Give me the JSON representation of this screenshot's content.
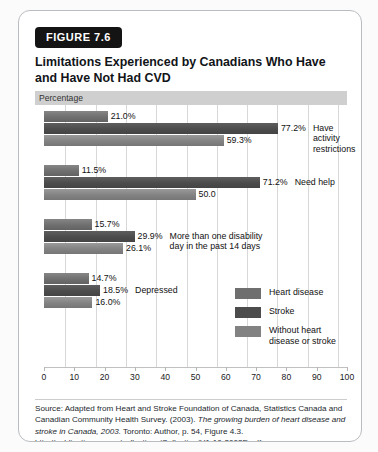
{
  "figure": {
    "badge": "FIGURE 7.6",
    "title": "Limitations Experienced by Canadians Who Have and Have Not Had CVD"
  },
  "axis_header": "Percentage",
  "source": {
    "prefix": "Source: Adapted from Heart and Stroke Foundation of Canada, Statistics Canada and Canadian Community Health Survey. (2003). ",
    "italic": "The growing burden of heart disease and stroke in Canada, 2003.",
    "suffix": " Toronto: Author, p. 54, Figure 4.3. http://publications.gc.ca/collections/Collection/H1-10-2003E.pdf"
  },
  "legend": {
    "position": "inside-bottom-right",
    "items": [
      {
        "label": "Heart disease",
        "color": "#6f6f6f"
      },
      {
        "label": "Stroke",
        "color": "#4c4c4c"
      },
      {
        "label": "Without heart\ndisease or stroke",
        "color": "#828282"
      }
    ]
  },
  "chart_data": {
    "type": "bar",
    "orientation": "horizontal",
    "title": "Limitations Experienced by Canadians Who Have and Have Not Had CVD",
    "xlabel": "Percentage",
    "ylabel": "",
    "xlim": [
      0,
      100
    ],
    "xticks": [
      0,
      10,
      20,
      30,
      40,
      50,
      60,
      70,
      80,
      90,
      100
    ],
    "grid": true,
    "categories": [
      "Have activity restrictions",
      "Need help",
      "More than one disability day in the past 14 days",
      "Depressed"
    ],
    "series": [
      {
        "name": "Heart disease",
        "color": "#6f6f6f",
        "values": [
          21.0,
          11.5,
          15.7,
          14.7
        ]
      },
      {
        "name": "Stroke",
        "color": "#4c4c4c",
        "values": [
          77.2,
          71.2,
          29.9,
          18.5
        ]
      },
      {
        "name": "Without heart disease or stroke",
        "color": "#828282",
        "values": [
          59.3,
          50.0,
          26.1,
          16.0
        ]
      }
    ],
    "data_labels": [
      [
        "21.0%",
        "77.2%",
        "59.3%"
      ],
      [
        "11.5%",
        "71.2%",
        "50.0"
      ],
      [
        "15.7%",
        "29.9%",
        "26.1%"
      ],
      [
        "14.7%",
        "18.5%",
        "16.0%"
      ]
    ],
    "category_label_anchor_series": 1
  },
  "tick_labels": [
    "0",
    "10",
    "20",
    "30",
    "40",
    "50",
    "60",
    "70",
    "80",
    "90",
    "100"
  ]
}
